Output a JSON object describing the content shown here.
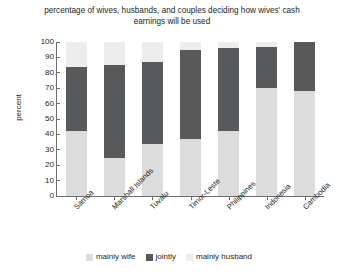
{
  "chart_data": {
    "type": "bar",
    "subtype": "stacked-bar-vertical-100",
    "title": "percentage of wives, husbands, and couples deciding how wives' cash earnings will be used",
    "xlabel": "",
    "ylabel": "percent",
    "ylim": [
      0,
      100
    ],
    "ytick_step": 10,
    "yticks": [
      100,
      90,
      80,
      70,
      60,
      50,
      40,
      30,
      20,
      10,
      0
    ],
    "grid": false,
    "legend_position": "bottom",
    "categories": [
      "Samoa",
      "Marshall Islands",
      "Tuvalu",
      "Timor-Leste",
      "Philippines",
      "Indonesia",
      "Cambodia"
    ],
    "series": [
      {
        "name": "mainly wife",
        "color": "#dcdcdc",
        "values": [
          42,
          25,
          34,
          37,
          42,
          70,
          68
        ]
      },
      {
        "name": "jointly",
        "color": "#58595b",
        "values": [
          42,
          60,
          53,
          58,
          54,
          27,
          32
        ]
      },
      {
        "name": "mainly husband",
        "color": "#ededed",
        "values": [
          16,
          15,
          13,
          5,
          4,
          3,
          0
        ]
      }
    ],
    "cumulative_tops": {
      "mainly wife": [
        42,
        25,
        34,
        37,
        42,
        70,
        68
      ],
      "jointly": [
        84,
        85,
        87,
        95,
        96,
        97,
        100
      ]
    }
  },
  "legend": {
    "items": [
      {
        "label": "mainly wife",
        "color": "#dcdcdc"
      },
      {
        "label": "jointly",
        "color": "#58595b"
      },
      {
        "label": "mainly husband",
        "color": "#ededed"
      }
    ]
  },
  "axis": {
    "line_color": "#6d6e71"
  }
}
